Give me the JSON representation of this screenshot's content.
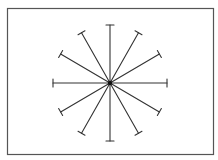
{
  "diagram": {
    "type": "radial-spokes",
    "spoke_count": 12,
    "angle_step_degrees": 30,
    "spoke_angles_degrees": [
      0,
      30,
      60,
      90,
      120,
      150,
      180,
      210,
      240,
      270,
      300,
      330
    ],
    "end_marker": "perpendicular-tick",
    "center_marker": "dot",
    "colors": {
      "background": "#ffffff",
      "frame": "#555555",
      "spoke": "#333333",
      "hub": "#111111"
    }
  }
}
